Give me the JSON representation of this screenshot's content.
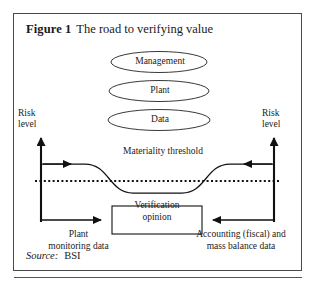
{
  "figure": {
    "number_label": "Figure 1",
    "caption": "The road to verifying value",
    "source_word": "Source:",
    "source_value": "BSI"
  },
  "axes": {
    "left_risk_label": "Risk\nlevel",
    "left_risk_line1": "Risk",
    "left_risk_line2": "level",
    "right_risk_line1": "Risk",
    "right_risk_line2": "level"
  },
  "nodes": {
    "ellipses": [
      {
        "id": "management",
        "label": "Management"
      },
      {
        "id": "plant",
        "label": "Plant"
      },
      {
        "id": "data",
        "label": "Data"
      }
    ],
    "threshold_label": "Materiality threshold",
    "outcome_box": {
      "line1": "Verification",
      "line2": "opinion"
    }
  },
  "inputs": {
    "left": {
      "line1": "Plant",
      "line2": "monitoring data"
    },
    "right": {
      "line1": "Accounting (fiscal) and",
      "line2": "mass balance data"
    }
  },
  "colors": {
    "frame_border": "#4a4a4a",
    "stroke": "#111111",
    "background": "#ffffff",
    "text": "#1a1a1a",
    "page_rule": "#555555"
  }
}
